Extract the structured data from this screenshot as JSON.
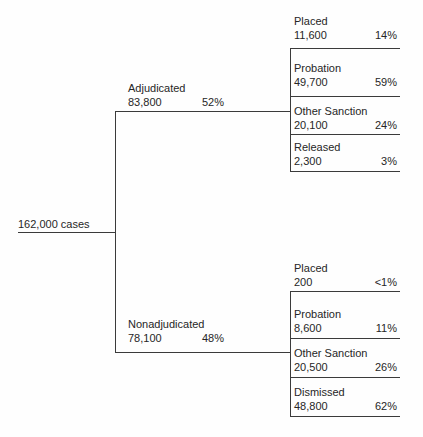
{
  "page": {
    "colors": {
      "bg": "#fefefe",
      "ink": "#262626",
      "line": "#3b3b3b"
    }
  },
  "tree": {
    "root": {
      "label": "162,000 cases"
    },
    "branches": [
      {
        "name": "Adjudicated",
        "value": "83,800",
        "pct": "52%",
        "outcomes": [
          {
            "name": "Placed",
            "value": "11,600",
            "pct": "14%"
          },
          {
            "name": "Probation",
            "value": "49,700",
            "pct": "59%"
          },
          {
            "name": "Other Sanction",
            "value": "20,100",
            "pct": "24%"
          },
          {
            "name": "Released",
            "value": "2,300",
            "pct": "3%"
          }
        ]
      },
      {
        "name": "Nonadjudicated",
        "value": "78,100",
        "pct": "48%",
        "outcomes": [
          {
            "name": "Placed",
            "value": "200",
            "pct": "<1%"
          },
          {
            "name": "Probation",
            "value": "8,600",
            "pct": "11%"
          },
          {
            "name": "Other Sanction",
            "value": "20,500",
            "pct": "26%"
          },
          {
            "name": "Dismissed",
            "value": "48,800",
            "pct": "62%"
          }
        ]
      }
    ]
  }
}
